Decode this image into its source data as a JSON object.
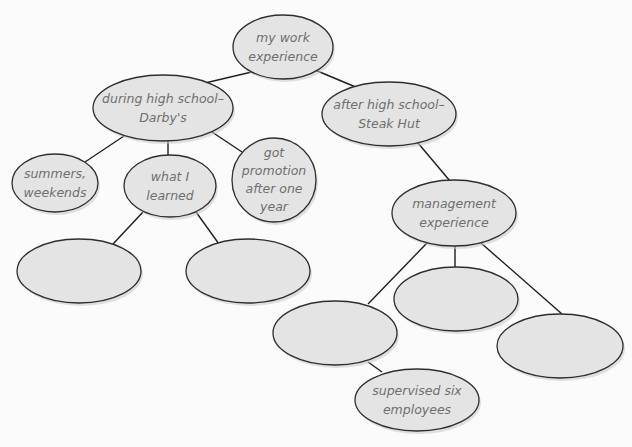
{
  "diagram": {
    "type": "tree-map",
    "colors": {
      "node_fill": "#e4e4e4",
      "node_stroke": "#2e2e2e",
      "edge": "#1e1e1e",
      "text": "#6f6f6f",
      "background": "#fbfbfb"
    },
    "nodes": {
      "root": {
        "label": "my work\nexperience"
      },
      "during_hs": {
        "label": "during high school–\nDarby's"
      },
      "after_hs": {
        "label": "after high school–\nSteak Hut"
      },
      "summers": {
        "label": "summers,\nweekends"
      },
      "what_learned": {
        "label": "what I\nlearned"
      },
      "promotion": {
        "label": "got\npromotion\nafter one\nyear"
      },
      "learned_blank_1": {
        "label": ""
      },
      "learned_blank_2": {
        "label": ""
      },
      "management": {
        "label": "management\nexperience"
      },
      "mgmt_blank_1": {
        "label": ""
      },
      "mgmt_blank_2": {
        "label": ""
      },
      "mgmt_blank_3": {
        "label": ""
      },
      "supervised": {
        "label": "supervised six\nemployees"
      }
    },
    "edges": [
      [
        "root",
        "during_hs"
      ],
      [
        "root",
        "after_hs"
      ],
      [
        "during_hs",
        "summers"
      ],
      [
        "during_hs",
        "what_learned"
      ],
      [
        "during_hs",
        "promotion"
      ],
      [
        "what_learned",
        "learned_blank_1"
      ],
      [
        "what_learned",
        "learned_blank_2"
      ],
      [
        "after_hs",
        "management"
      ],
      [
        "management",
        "mgmt_blank_1"
      ],
      [
        "management",
        "mgmt_blank_2"
      ],
      [
        "management",
        "mgmt_blank_3"
      ],
      [
        "mgmt_blank_1",
        "supervised"
      ]
    ]
  }
}
